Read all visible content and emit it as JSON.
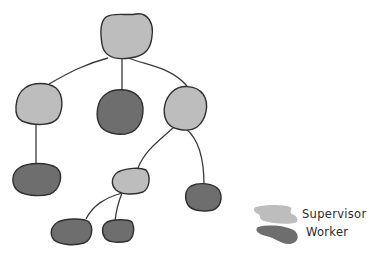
{
  "diagram": {
    "type": "hierarchy-tree",
    "colors": {
      "supervisor": "#bdbdbd",
      "worker": "#6e6e6e",
      "stroke": "#2f2f2f",
      "edge": "#3a3a3a"
    },
    "nodes": [
      {
        "id": "root",
        "role": "supervisor"
      },
      {
        "id": "l1-left",
        "role": "supervisor"
      },
      {
        "id": "l1-middle",
        "role": "worker"
      },
      {
        "id": "l1-right",
        "role": "supervisor"
      },
      {
        "id": "l2-left",
        "role": "worker"
      },
      {
        "id": "l2-middle",
        "role": "supervisor"
      },
      {
        "id": "l2-right",
        "role": "worker"
      },
      {
        "id": "l3-left",
        "role": "worker"
      },
      {
        "id": "l3-right",
        "role": "worker"
      }
    ],
    "edges": [
      [
        "root",
        "l1-left"
      ],
      [
        "root",
        "l1-middle"
      ],
      [
        "root",
        "l1-right"
      ],
      [
        "l1-left",
        "l2-left"
      ],
      [
        "l1-right",
        "l2-middle"
      ],
      [
        "l1-right",
        "l2-right"
      ],
      [
        "l2-middle",
        "l3-left"
      ],
      [
        "l2-middle",
        "l3-right"
      ]
    ]
  },
  "legend": {
    "items": [
      {
        "label": "Supervisor",
        "color": "#bdbdbd"
      },
      {
        "label": "Worker",
        "color": "#6e6e6e"
      }
    ]
  }
}
